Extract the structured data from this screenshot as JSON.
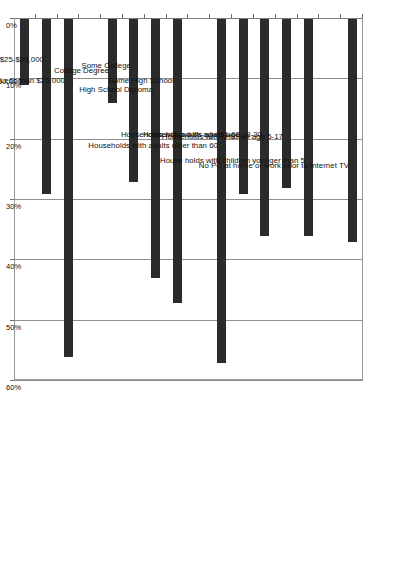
{
  "chart_data": {
    "type": "bar",
    "orientation": "rotated-90",
    "title": "",
    "subtitle": "",
    "xlabel": "",
    "ylabel": "",
    "ylim": [
      0,
      60
    ],
    "y_tick_labels": [
      "0%",
      "10%",
      "20%",
      "30%",
      "40%",
      "50%",
      "60%"
    ],
    "y_ticks": [
      0,
      10,
      20,
      30,
      40,
      50,
      60
    ],
    "grid": true,
    "legend": null,
    "series_color": "#2b2b2b",
    "categories": [
      "No PC at home or work prior to Internet TV",
      "",
      "House holds with children younger than 5",
      "Households with children age 5-17",
      "Households with adults age 18-30",
      "Households with adults age 31-60",
      "Households with adults older than 60",
      "",
      "Some High School",
      "High School Diploma",
      "Some College",
      "College Degree",
      "",
      "Less than $25,000",
      "$25-$50,000",
      "More than $50,000"
    ],
    "values": [
      37,
      null,
      36,
      28,
      36,
      29,
      57,
      null,
      47,
      43,
      27,
      14,
      null,
      56,
      29,
      11
    ],
    "bars": [
      {
        "label": "No PC at home or work prior to Internet TV",
        "value": 37
      },
      {
        "label": "House holds with children younger than 5",
        "value": 36
      },
      {
        "label": "Households with children age 5-17",
        "value": 28
      },
      {
        "label": "Households with adults age 18-30",
        "value": 36
      },
      {
        "label": "Households with adults age 31-60",
        "value": 29
      },
      {
        "label": "Households with adults older than 60",
        "value": 57
      },
      {
        "label": "Some High School",
        "value": 47
      },
      {
        "label": "High School Diploma",
        "value": 43
      },
      {
        "label": "Some College",
        "value": 27
      },
      {
        "label": "College Degree",
        "value": 14
      },
      {
        "label": "Less than $25,000",
        "value": 56
      },
      {
        "label": "$25-$50,000",
        "value": 29
      },
      {
        "label": "More than $50,000",
        "value": 11
      }
    ]
  }
}
